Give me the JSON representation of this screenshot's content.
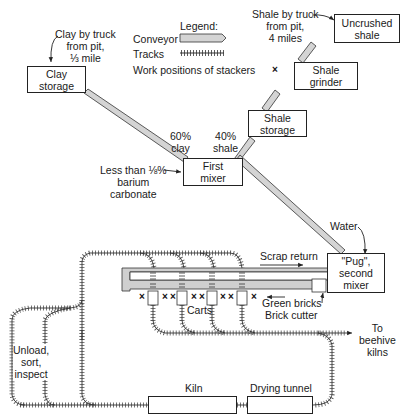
{
  "legend": {
    "title": "Legend:",
    "items": [
      {
        "label": "Conveyor",
        "symbol": "conveyor"
      },
      {
        "label": "Tracks",
        "symbol": "tracks"
      },
      {
        "label": "Work positions of stackers",
        "symbol": "×"
      }
    ]
  },
  "inputs": {
    "clay_source": "Clay by truck\nfrom pit,\n⅓ mile",
    "shale_source": "Shale by truck\nfrom pit,\n4 miles",
    "barium": "Less than ⅛%\nbarium\ncarbonate",
    "water": "Water"
  },
  "boxes": {
    "clay_storage": "Clay\nstorage",
    "uncrushed_shale": "Uncrushed\nshale",
    "shale_grinder": "Shale\ngrinder",
    "shale_storage": "Shale\nstorage",
    "first_mixer": "First\nmixer",
    "pug_mixer": "\"Pug\",\nsecond\nmixer",
    "kiln": "Kiln",
    "drying_tunnel": "Drying tunnel"
  },
  "ratios": {
    "clay": "60%\nclay",
    "shale": "40%\nshale"
  },
  "labels": {
    "scrap_return": "Scrap return",
    "green_bricks": "Green bricks",
    "brick_cutter": "Brick cutter",
    "carts": "Carts",
    "beehive": "To\nbeehive\nkilns",
    "unload": "Unload,\nsort,\ninspect"
  },
  "stacker_mark": "×"
}
